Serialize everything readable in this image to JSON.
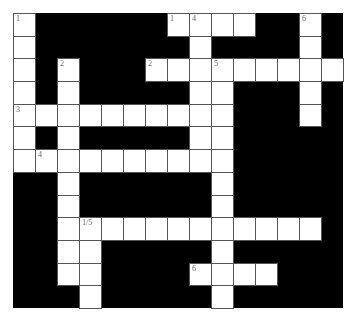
{
  "puzzle": {
    "rows": 13,
    "cols": 15,
    "colors": {
      "fill": "#ffffff",
      "block": "#000000",
      "border": "#555555",
      "number": "#666666"
    },
    "layout": [
      "O......OOOO..O.",
      "O.......O....O.",
      "O.O...OOOOOOOOO",
      "O.O.....OO...O.",
      "OOOOOOOOOO...O.",
      "O.O.....OO.....",
      "OOOOOOOOOO.....",
      "..O......O.....",
      "..O......O.....",
      "..OOOOOOOOOOOO.",
      "..OO.....O.....",
      "..OO....OOOO...",
      "...O.....O....."
    ],
    "numbers": [
      {
        "row": 0,
        "col": 0,
        "label": "1"
      },
      {
        "row": 0,
        "col": 7,
        "label": "1"
      },
      {
        "row": 0,
        "col": 8,
        "label": "4"
      },
      {
        "row": 0,
        "col": 13,
        "label": "6"
      },
      {
        "row": 2,
        "col": 2,
        "label": "2"
      },
      {
        "row": 2,
        "col": 6,
        "label": "2"
      },
      {
        "row": 2,
        "col": 9,
        "label": "5"
      },
      {
        "row": 4,
        "col": 0,
        "label": "3"
      },
      {
        "row": 6,
        "col": 1,
        "label": "4"
      },
      {
        "row": 9,
        "col": 3,
        "label": "1/5"
      },
      {
        "row": 11,
        "col": 8,
        "label": "6"
      }
    ]
  }
}
